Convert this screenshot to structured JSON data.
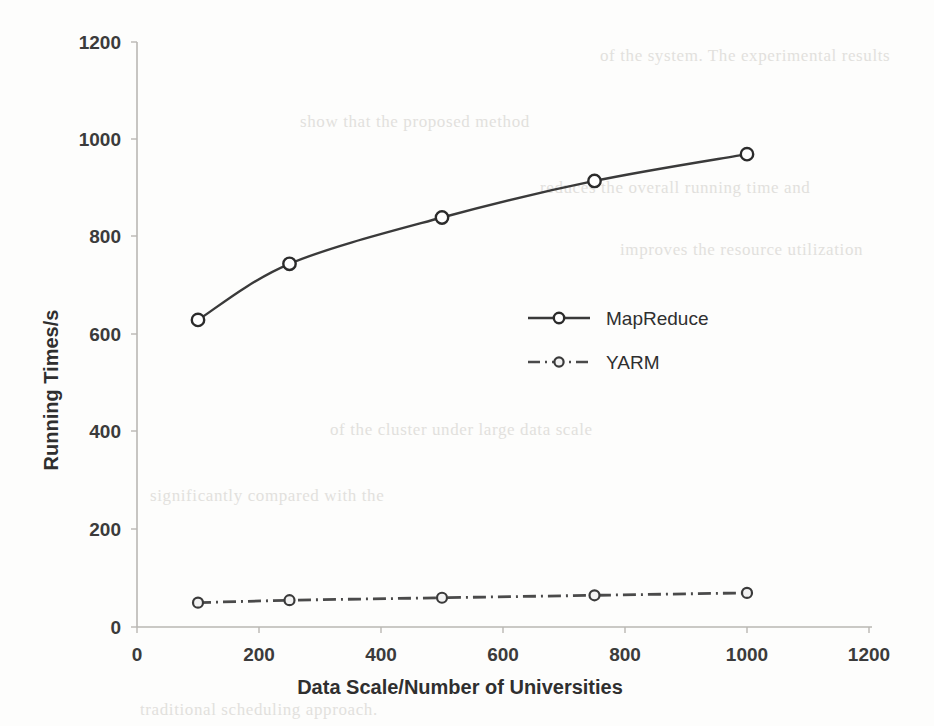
{
  "chart_data": {
    "type": "line",
    "title": "",
    "xlabel": "Data Scale/Number of Universities",
    "ylabel": "Running Times/s",
    "xlim": [
      0,
      1200
    ],
    "ylim": [
      0,
      1200
    ],
    "xticks": [
      0,
      200,
      400,
      600,
      800,
      1000,
      1200
    ],
    "yticks": [
      0,
      200,
      400,
      600,
      800,
      1000,
      1200
    ],
    "xtick_labels": [
      "0",
      "200",
      "400",
      "600",
      "800",
      "1000",
      "1200"
    ],
    "ytick_labels": [
      "0",
      "200",
      "400",
      "600",
      "800",
      "1000",
      "1200"
    ],
    "grid": false,
    "legend_position": "center",
    "x": [
      100,
      250,
      500,
      750,
      1000
    ],
    "series": [
      {
        "name": "MapReduce",
        "values": [
          630,
          745,
          840,
          915,
          970
        ],
        "line_style": "solid",
        "marker": "open-circle",
        "color": "#3a3a3a"
      },
      {
        "name": "YARM",
        "values": [
          50,
          55,
          60,
          65,
          70
        ],
        "line_style": "dash-dot",
        "marker": "small-circle",
        "color": "#4a4a4a"
      }
    ]
  },
  "legend": {
    "entries": [
      {
        "label": "MapReduce"
      },
      {
        "label": "YARM"
      }
    ]
  },
  "axes": {
    "x_title": "Data Scale/Number of Universities",
    "y_title": "Running Times/s",
    "x_tick_0": "0",
    "x_tick_1": "200",
    "x_tick_2": "400",
    "x_tick_3": "600",
    "x_tick_4": "800",
    "x_tick_5": "1000",
    "x_tick_6": "1200",
    "y_tick_0": "0",
    "y_tick_1": "200",
    "y_tick_2": "400",
    "y_tick_3": "600",
    "y_tick_4": "800",
    "y_tick_5": "1000",
    "y_tick_6": "1200"
  },
  "background_artifacts": {
    "note": "faint bleed-through text from scanned page",
    "lines": [
      "of the system. The experimental results",
      "show that the proposed method",
      "reduces the overall running time and",
      "improves the resource utilization",
      "of the cluster under large data scale",
      "significantly compared with the",
      "traditional scheduling approach."
    ]
  },
  "colors": {
    "series_primary": "#3a3a3a",
    "series_secondary": "#4a4a4a",
    "axis": "#b9b7b3",
    "text": "#2f2f2f",
    "background": "#fdfdfc"
  }
}
